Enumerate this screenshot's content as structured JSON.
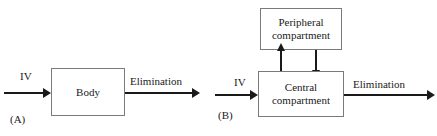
{
  "figure": {
    "background_color": "#ffffff",
    "line_color": "#1a1a1a",
    "box_border_color": "#7a7a7a"
  },
  "panel_a": {
    "tag": "(A)",
    "input_label": "IV",
    "box_label": "Body",
    "output_label": "Elimination"
  },
  "panel_b": {
    "tag": "(B)",
    "input_label": "IV",
    "peripheral_box_line1": "Peripheral",
    "peripheral_box_line2": "compartment",
    "central_box_line1": "Central",
    "central_box_line2": "compartment",
    "output_label": "Elimination"
  }
}
